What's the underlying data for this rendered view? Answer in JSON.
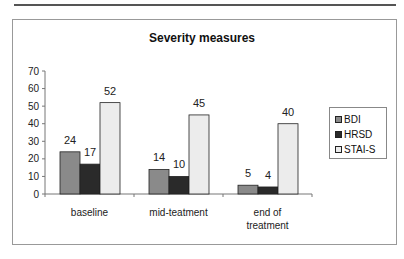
{
  "chart_data": {
    "type": "bar",
    "title": "Severity measures",
    "xlabel": "",
    "ylabel": "",
    "ylim": [
      0,
      70
    ],
    "yticks": [
      0,
      10,
      20,
      30,
      40,
      50,
      60,
      70
    ],
    "categories": [
      "baseline",
      "mid-teatment",
      "end of treatment"
    ],
    "category_label_lines": [
      [
        "baseline"
      ],
      [
        "mid-teatment"
      ],
      [
        "end of",
        "treatment"
      ]
    ],
    "series": [
      {
        "name": "BDI",
        "values": [
          24,
          14,
          5
        ],
        "color": "#8a8a8a",
        "pattern": "hatched-gray"
      },
      {
        "name": "HRSD",
        "values": [
          17,
          10,
          4
        ],
        "color": "#2a2a2a",
        "pattern": "dark"
      },
      {
        "name": "STAI-S",
        "values": [
          52,
          45,
          40
        ],
        "color": "#ececec",
        "pattern": "light-dotted"
      }
    ],
    "data_labels": true,
    "grid": false,
    "legend_position": "right"
  }
}
